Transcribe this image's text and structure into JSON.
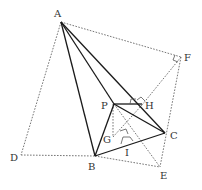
{
  "diagram": {
    "points": {
      "A": {
        "label": "A",
        "x": 61,
        "y": 22
      },
      "B": {
        "label": "B",
        "x": 95,
        "y": 156
      },
      "C": {
        "label": "C",
        "x": 165,
        "y": 133
      },
      "D": {
        "label": "D",
        "x": 21,
        "y": 155
      },
      "E": {
        "label": "E",
        "x": 160,
        "y": 167
      },
      "F": {
        "label": "F",
        "x": 181,
        "y": 57
      },
      "G": {
        "label": "G",
        "x": 114,
        "y": 137
      },
      "H": {
        "label": "H",
        "x": 142,
        "y": 105
      },
      "I": {
        "label": "I",
        "x": 128,
        "y": 145
      },
      "P": {
        "label": "P",
        "x": 114,
        "y": 104
      }
    },
    "solid_segments": [
      "AB",
      "AP",
      "AC",
      "PB",
      "PC",
      "PH",
      "BC"
    ],
    "dotted_segments": [
      "AD",
      "DB",
      "AF",
      "FH",
      "FE",
      "BE",
      "PG",
      "PE",
      "GH"
    ],
    "right_angle_marks": [
      "F",
      "H",
      "P-H",
      "I"
    ]
  }
}
